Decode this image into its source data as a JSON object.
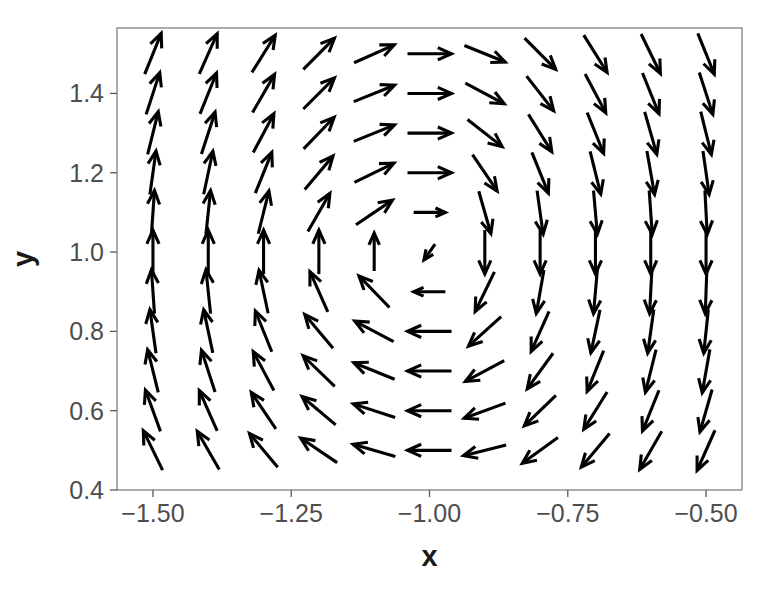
{
  "chart_data": {
    "type": "quiver",
    "title": "",
    "subtitle": "",
    "xlabel": "x",
    "ylabel": "y",
    "xlim": [
      -1.565,
      -0.435
    ],
    "ylim": [
      0.4,
      1.565
    ],
    "xticks": [
      -1.5,
      -1.25,
      -1.0,
      -0.75,
      -0.5
    ],
    "xticklabels": [
      "−1.50",
      "−1.25",
      "−1.00",
      "−0.75",
      "−0.50"
    ],
    "yticks": [
      0.4,
      0.6,
      0.8,
      1.0,
      1.2,
      1.4
    ],
    "yticklabels": [
      "0.4",
      "0.6",
      "0.8",
      "1.0",
      "1.2",
      "1.4"
    ],
    "grid": false,
    "legend": null,
    "annotations": [],
    "arrow_color": "#000000",
    "panel_background": "#ffffff",
    "panel_border_color": "#808080",
    "grid_x": [
      -1.5,
      -1.4,
      -1.3,
      -1.2,
      -1.1,
      -1.0,
      -0.9,
      -0.8,
      -0.7,
      -0.6,
      -0.5
    ],
    "grid_y": [
      0.5,
      0.6,
      0.7,
      0.8,
      0.9,
      1.0,
      1.1,
      1.2,
      1.3,
      1.4,
      1.5
    ],
    "vectors": [
      {
        "x": -1.5,
        "y": 1.5,
        "angle_deg": 68,
        "len": 1.0
      },
      {
        "x": -1.4,
        "y": 1.5,
        "angle_deg": 66,
        "len": 1.0
      },
      {
        "x": -1.3,
        "y": 1.5,
        "angle_deg": 58,
        "len": 1.0
      },
      {
        "x": -1.2,
        "y": 1.5,
        "angle_deg": 45,
        "len": 1.0
      },
      {
        "x": -1.1,
        "y": 1.5,
        "angle_deg": 24,
        "len": 1.0
      },
      {
        "x": -1.0,
        "y": 1.5,
        "angle_deg": 0,
        "len": 1.0
      },
      {
        "x": -0.9,
        "y": 1.5,
        "angle_deg": -22,
        "len": 1.0
      },
      {
        "x": -0.8,
        "y": 1.5,
        "angle_deg": -45,
        "len": 1.0
      },
      {
        "x": -0.7,
        "y": 1.5,
        "angle_deg": -58,
        "len": 1.0
      },
      {
        "x": -0.6,
        "y": 1.5,
        "angle_deg": -64,
        "len": 1.0
      },
      {
        "x": -0.5,
        "y": 1.5,
        "angle_deg": -68,
        "len": 1.0
      },
      {
        "x": -1.5,
        "y": 1.4,
        "angle_deg": 72,
        "len": 1.0
      },
      {
        "x": -1.4,
        "y": 1.4,
        "angle_deg": 68,
        "len": 1.0
      },
      {
        "x": -1.3,
        "y": 1.4,
        "angle_deg": 60,
        "len": 1.0
      },
      {
        "x": -1.2,
        "y": 1.4,
        "angle_deg": 45,
        "len": 1.0
      },
      {
        "x": -1.1,
        "y": 1.4,
        "angle_deg": 22,
        "len": 1.0
      },
      {
        "x": -1.0,
        "y": 1.4,
        "angle_deg": 0,
        "len": 1.0
      },
      {
        "x": -0.9,
        "y": 1.4,
        "angle_deg": -28,
        "len": 1.0
      },
      {
        "x": -0.8,
        "y": 1.4,
        "angle_deg": -52,
        "len": 1.0
      },
      {
        "x": -0.7,
        "y": 1.4,
        "angle_deg": -62,
        "len": 1.0
      },
      {
        "x": -0.6,
        "y": 1.4,
        "angle_deg": -68,
        "len": 1.0
      },
      {
        "x": -0.5,
        "y": 1.4,
        "angle_deg": -72,
        "len": 1.0
      },
      {
        "x": -1.5,
        "y": 1.3,
        "angle_deg": 76,
        "len": 1.0
      },
      {
        "x": -1.4,
        "y": 1.3,
        "angle_deg": 72,
        "len": 1.0
      },
      {
        "x": -1.3,
        "y": 1.3,
        "angle_deg": 62,
        "len": 1.0
      },
      {
        "x": -1.2,
        "y": 1.3,
        "angle_deg": 46,
        "len": 1.0
      },
      {
        "x": -1.1,
        "y": 1.3,
        "angle_deg": 22,
        "len": 1.0
      },
      {
        "x": -1.0,
        "y": 1.3,
        "angle_deg": 0,
        "len": 1.0
      },
      {
        "x": -0.9,
        "y": 1.3,
        "angle_deg": -38,
        "len": 1.0
      },
      {
        "x": -0.8,
        "y": 1.3,
        "angle_deg": -58,
        "len": 1.0
      },
      {
        "x": -0.7,
        "y": 1.3,
        "angle_deg": -68,
        "len": 1.0
      },
      {
        "x": -0.6,
        "y": 1.3,
        "angle_deg": -74,
        "len": 1.0
      },
      {
        "x": -0.5,
        "y": 1.3,
        "angle_deg": -76,
        "len": 1.0
      },
      {
        "x": -1.5,
        "y": 1.2,
        "angle_deg": 82,
        "len": 1.0
      },
      {
        "x": -1.4,
        "y": 1.2,
        "angle_deg": 78,
        "len": 1.0
      },
      {
        "x": -1.3,
        "y": 1.2,
        "angle_deg": 68,
        "len": 1.0
      },
      {
        "x": -1.2,
        "y": 1.2,
        "angle_deg": 50,
        "len": 1.0
      },
      {
        "x": -1.1,
        "y": 1.2,
        "angle_deg": 26,
        "len": 1.0
      },
      {
        "x": -1.0,
        "y": 1.2,
        "angle_deg": 0,
        "len": 1.0
      },
      {
        "x": -0.9,
        "y": 1.2,
        "angle_deg": -56,
        "len": 1.0
      },
      {
        "x": -0.8,
        "y": 1.2,
        "angle_deg": -68,
        "len": 1.0
      },
      {
        "x": -0.7,
        "y": 1.2,
        "angle_deg": -76,
        "len": 1.0
      },
      {
        "x": -0.6,
        "y": 1.2,
        "angle_deg": -80,
        "len": 1.0
      },
      {
        "x": -0.5,
        "y": 1.2,
        "angle_deg": -82,
        "len": 1.0
      },
      {
        "x": -1.5,
        "y": 1.1,
        "angle_deg": 86,
        "len": 1.0
      },
      {
        "x": -1.4,
        "y": 1.1,
        "angle_deg": 84,
        "len": 1.0
      },
      {
        "x": -1.3,
        "y": 1.1,
        "angle_deg": 76,
        "len": 1.0
      },
      {
        "x": -1.2,
        "y": 1.1,
        "angle_deg": 60,
        "len": 1.0
      },
      {
        "x": -1.1,
        "y": 1.1,
        "angle_deg": 34,
        "len": 1.0
      },
      {
        "x": -1.0,
        "y": 1.1,
        "angle_deg": 0,
        "len": 0.72
      },
      {
        "x": -0.9,
        "y": 1.1,
        "angle_deg": -74,
        "len": 1.0
      },
      {
        "x": -0.8,
        "y": 1.1,
        "angle_deg": -82,
        "len": 1.0
      },
      {
        "x": -0.7,
        "y": 1.1,
        "angle_deg": -85,
        "len": 1.0
      },
      {
        "x": -0.6,
        "y": 1.1,
        "angle_deg": -86,
        "len": 1.0
      },
      {
        "x": -0.5,
        "y": 1.1,
        "angle_deg": -87,
        "len": 1.0
      },
      {
        "x": -1.5,
        "y": 1.0,
        "angle_deg": 90,
        "len": 1.0
      },
      {
        "x": -1.4,
        "y": 1.0,
        "angle_deg": 90,
        "len": 1.0
      },
      {
        "x": -1.3,
        "y": 1.0,
        "angle_deg": 90,
        "len": 1.0
      },
      {
        "x": -1.2,
        "y": 1.0,
        "angle_deg": 90,
        "len": 1.0
      },
      {
        "x": -1.1,
        "y": 1.0,
        "angle_deg": 90,
        "len": 0.86
      },
      {
        "x": -1.0,
        "y": 1.0,
        "angle_deg": -125,
        "len": 0.44
      },
      {
        "x": -0.9,
        "y": 1.0,
        "angle_deg": -90,
        "len": 1.0
      },
      {
        "x": -0.8,
        "y": 1.0,
        "angle_deg": -90,
        "len": 1.0
      },
      {
        "x": -0.7,
        "y": 1.0,
        "angle_deg": -90,
        "len": 1.0
      },
      {
        "x": -0.6,
        "y": 1.0,
        "angle_deg": -90,
        "len": 1.0
      },
      {
        "x": -0.5,
        "y": 1.0,
        "angle_deg": -90,
        "len": 1.0
      },
      {
        "x": -1.5,
        "y": 0.9,
        "angle_deg": 94,
        "len": 1.0
      },
      {
        "x": -1.4,
        "y": 0.9,
        "angle_deg": 96,
        "len": 1.0
      },
      {
        "x": -1.3,
        "y": 0.9,
        "angle_deg": 102,
        "len": 1.0
      },
      {
        "x": -1.2,
        "y": 0.9,
        "angle_deg": 114,
        "len": 1.0
      },
      {
        "x": -1.1,
        "y": 0.9,
        "angle_deg": 134,
        "len": 1.0
      },
      {
        "x": -1.0,
        "y": 0.9,
        "angle_deg": 180,
        "len": 0.72
      },
      {
        "x": -0.9,
        "y": 0.9,
        "angle_deg": -116,
        "len": 1.0
      },
      {
        "x": -0.8,
        "y": 0.9,
        "angle_deg": -100,
        "len": 1.0
      },
      {
        "x": -0.7,
        "y": 0.9,
        "angle_deg": -95,
        "len": 1.0
      },
      {
        "x": -0.6,
        "y": 0.9,
        "angle_deg": -93,
        "len": 1.0
      },
      {
        "x": -0.5,
        "y": 0.9,
        "angle_deg": -92,
        "len": 1.0
      },
      {
        "x": -1.5,
        "y": 0.8,
        "angle_deg": 98,
        "len": 1.0
      },
      {
        "x": -1.4,
        "y": 0.8,
        "angle_deg": 102,
        "len": 1.0
      },
      {
        "x": -1.3,
        "y": 0.8,
        "angle_deg": 112,
        "len": 1.0
      },
      {
        "x": -1.2,
        "y": 0.8,
        "angle_deg": 130,
        "len": 1.0
      },
      {
        "x": -1.1,
        "y": 0.8,
        "angle_deg": 152,
        "len": 1.0
      },
      {
        "x": -1.0,
        "y": 0.8,
        "angle_deg": 180,
        "len": 1.0
      },
      {
        "x": -0.9,
        "y": 0.8,
        "angle_deg": -138,
        "len": 1.0
      },
      {
        "x": -0.8,
        "y": 0.8,
        "angle_deg": -114,
        "len": 1.0
      },
      {
        "x": -0.7,
        "y": 0.8,
        "angle_deg": -102,
        "len": 1.0
      },
      {
        "x": -0.6,
        "y": 0.8,
        "angle_deg": -98,
        "len": 1.0
      },
      {
        "x": -0.5,
        "y": 0.8,
        "angle_deg": -96,
        "len": 1.0
      },
      {
        "x": -1.5,
        "y": 0.7,
        "angle_deg": 104,
        "len": 1.0
      },
      {
        "x": -1.4,
        "y": 0.7,
        "angle_deg": 108,
        "len": 1.0
      },
      {
        "x": -1.3,
        "y": 0.7,
        "angle_deg": 118,
        "len": 1.0
      },
      {
        "x": -1.2,
        "y": 0.7,
        "angle_deg": 136,
        "len": 1.0
      },
      {
        "x": -1.1,
        "y": 0.7,
        "angle_deg": 158,
        "len": 1.0
      },
      {
        "x": -1.0,
        "y": 0.7,
        "angle_deg": 180,
        "len": 1.0
      },
      {
        "x": -0.9,
        "y": 0.7,
        "angle_deg": -152,
        "len": 1.0
      },
      {
        "x": -0.8,
        "y": 0.7,
        "angle_deg": -126,
        "len": 1.0
      },
      {
        "x": -0.7,
        "y": 0.7,
        "angle_deg": -112,
        "len": 1.0
      },
      {
        "x": -0.6,
        "y": 0.7,
        "angle_deg": -104,
        "len": 1.0
      },
      {
        "x": -0.5,
        "y": 0.7,
        "angle_deg": -100,
        "len": 1.0
      },
      {
        "x": -1.5,
        "y": 0.6,
        "angle_deg": 110,
        "len": 1.0
      },
      {
        "x": -1.4,
        "y": 0.6,
        "angle_deg": 114,
        "len": 1.0
      },
      {
        "x": -1.3,
        "y": 0.6,
        "angle_deg": 124,
        "len": 1.0
      },
      {
        "x": -1.2,
        "y": 0.6,
        "angle_deg": 140,
        "len": 1.0
      },
      {
        "x": -1.1,
        "y": 0.6,
        "angle_deg": 162,
        "len": 1.0
      },
      {
        "x": -1.0,
        "y": 0.6,
        "angle_deg": 180,
        "len": 1.0
      },
      {
        "x": -0.9,
        "y": 0.6,
        "angle_deg": -160,
        "len": 1.0
      },
      {
        "x": -0.8,
        "y": 0.6,
        "angle_deg": -136,
        "len": 1.0
      },
      {
        "x": -0.7,
        "y": 0.6,
        "angle_deg": -122,
        "len": 1.0
      },
      {
        "x": -0.6,
        "y": 0.6,
        "angle_deg": -112,
        "len": 1.0
      },
      {
        "x": -0.5,
        "y": 0.6,
        "angle_deg": -106,
        "len": 1.0
      },
      {
        "x": -1.5,
        "y": 0.5,
        "angle_deg": 116,
        "len": 1.0
      },
      {
        "x": -1.4,
        "y": 0.5,
        "angle_deg": 120,
        "len": 1.0
      },
      {
        "x": -1.3,
        "y": 0.5,
        "angle_deg": 130,
        "len": 1.0
      },
      {
        "x": -1.2,
        "y": 0.5,
        "angle_deg": 146,
        "len": 1.0
      },
      {
        "x": -1.1,
        "y": 0.5,
        "angle_deg": 164,
        "len": 1.0
      },
      {
        "x": -1.0,
        "y": 0.5,
        "angle_deg": 180,
        "len": 1.0
      },
      {
        "x": -0.9,
        "y": 0.5,
        "angle_deg": -166,
        "len": 1.0
      },
      {
        "x": -0.8,
        "y": 0.5,
        "angle_deg": -144,
        "len": 1.0
      },
      {
        "x": -0.7,
        "y": 0.5,
        "angle_deg": -130,
        "len": 1.0
      },
      {
        "x": -0.6,
        "y": 0.5,
        "angle_deg": -120,
        "len": 1.0
      },
      {
        "x": -0.5,
        "y": 0.5,
        "angle_deg": -114,
        "len": 1.0
      }
    ]
  }
}
